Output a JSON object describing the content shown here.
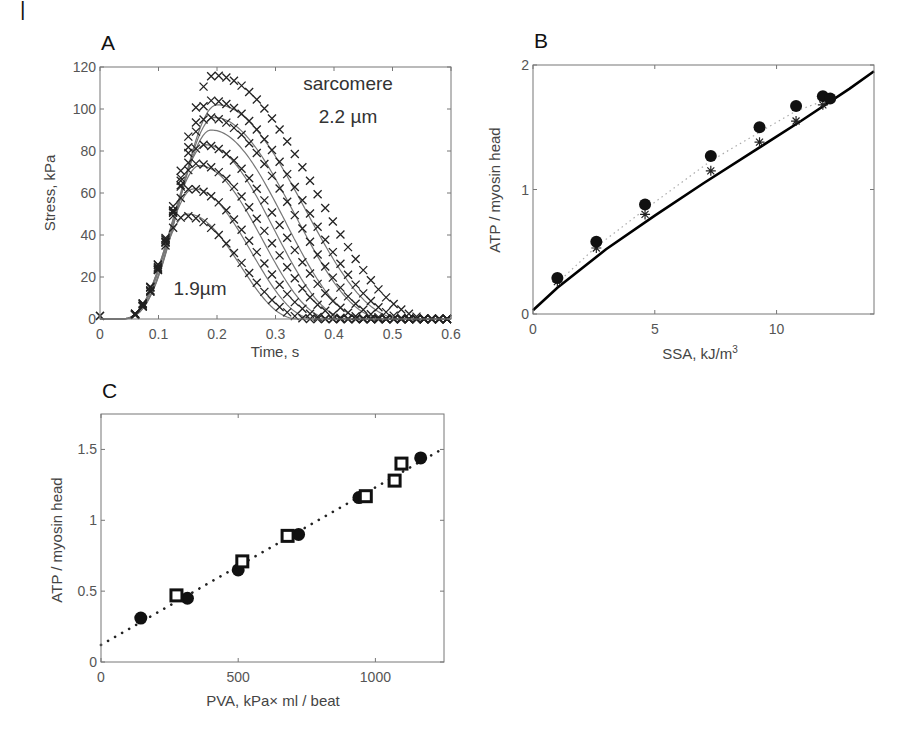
{
  "figure": {
    "corner_mark": "|",
    "panels": [
      {
        "letter": "A"
      },
      {
        "letter": "B"
      },
      {
        "letter": "C"
      }
    ]
  },
  "chart_data": [
    {
      "panel": "A",
      "type": "line",
      "title": "",
      "xlabel": "Time, s",
      "ylabel": "Stress, kPa",
      "xlim": [
        0,
        0.6
      ],
      "ylim": [
        0,
        120
      ],
      "xticks": [
        "0",
        "0.1",
        "0.2",
        "0.3",
        "0.4",
        "0.5",
        "0.6"
      ],
      "yticks": [
        "0",
        "20",
        "40",
        "60",
        "80",
        "100",
        "120"
      ],
      "grid": false,
      "annotations": [
        {
          "text": "sarcomere",
          "x": 0.38,
          "y": 112
        },
        {
          "text": "2.2  µm",
          "x": 0.38,
          "y": 98
        },
        {
          "text": "1.9µm",
          "x": 0.17,
          "y": 12
        }
      ],
      "series": [
        {
          "name": "model 1.9 µm",
          "style": "solid-gray",
          "peak_time": 0.15,
          "peak": 50,
          "end_time": 0.34
        },
        {
          "name": "model",
          "style": "solid-gray",
          "peak_time": 0.16,
          "peak": 62,
          "end_time": 0.37
        },
        {
          "name": "model",
          "style": "solid-gray",
          "peak_time": 0.17,
          "peak": 73,
          "end_time": 0.4
        },
        {
          "name": "model",
          "style": "solid-gray",
          "peak_time": 0.18,
          "peak": 83,
          "end_time": 0.43
        },
        {
          "name": "model",
          "style": "solid-gray",
          "peak_time": 0.19,
          "peak": 90,
          "end_time": 0.46
        },
        {
          "name": "model",
          "style": "solid-gray",
          "peak_time": 0.195,
          "peak": 96,
          "end_time": 0.49
        },
        {
          "name": "model 2.2 µm",
          "style": "solid-gray",
          "peak_time": 0.2,
          "peak": 102,
          "end_time": 0.52
        },
        {
          "name": "experiment (x markers)",
          "style": "x-markers",
          "peaks": [
            49,
            62,
            74,
            83,
            96,
            104,
            116
          ]
        }
      ]
    },
    {
      "panel": "B",
      "type": "scatter",
      "title": "",
      "xlabel": "SSA, kJ/m",
      "xlabel_superscript": "3",
      "ylabel": "ATP / myosin head",
      "xlim": [
        0,
        14
      ],
      "ylim": [
        0,
        2
      ],
      "xticks": [
        "0",
        "5",
        "10"
      ],
      "yticks": [
        "0",
        "1",
        "2"
      ],
      "grid": false,
      "series": [
        {
          "name": "filled circles (dotted fit)",
          "marker": "circle",
          "x": [
            1.0,
            2.6,
            4.6,
            7.3,
            9.3,
            10.8,
            11.9,
            12.2
          ],
          "y": [
            0.29,
            0.58,
            0.88,
            1.27,
            1.5,
            1.67,
            1.75,
            1.73
          ]
        },
        {
          "name": "stars",
          "marker": "star",
          "x": [
            1.0,
            2.6,
            4.6,
            7.3,
            9.3,
            10.8,
            11.9
          ],
          "y": [
            0.26,
            0.53,
            0.8,
            1.15,
            1.38,
            1.55,
            1.68
          ]
        },
        {
          "name": "model (solid line)",
          "marker": "none",
          "style": "solid-black",
          "x": [
            0,
            1,
            3,
            5,
            7,
            9,
            11,
            13,
            14
          ],
          "y": [
            0.03,
            0.21,
            0.52,
            0.79,
            1.05,
            1.3,
            1.55,
            1.81,
            1.95
          ]
        }
      ]
    },
    {
      "panel": "C",
      "type": "scatter",
      "title": "",
      "xlabel": "PVA, kPa× ml / beat",
      "ylabel": "ATP / myosin head",
      "xlim": [
        0,
        1250
      ],
      "ylim": [
        0,
        1.75
      ],
      "xticks": [
        "0",
        "500",
        "1000"
      ],
      "yticks": [
        "0",
        "0.5",
        "1",
        "1.5"
      ],
      "grid": false,
      "series": [
        {
          "name": "filled circles",
          "marker": "circle",
          "x": [
            145,
            315,
            500,
            720,
            940,
            1165
          ],
          "y": [
            0.31,
            0.45,
            0.65,
            0.9,
            1.16,
            1.44
          ]
        },
        {
          "name": "open squares",
          "marker": "square",
          "x": [
            275,
            515,
            680,
            965,
            1070,
            1095
          ],
          "y": [
            0.47,
            0.71,
            0.89,
            1.17,
            1.28,
            1.4
          ]
        },
        {
          "name": "linear fit (dotted)",
          "marker": "none",
          "style": "dotted-black",
          "x": [
            0,
            1250
          ],
          "y": [
            0.12,
            1.51
          ]
        }
      ]
    }
  ]
}
